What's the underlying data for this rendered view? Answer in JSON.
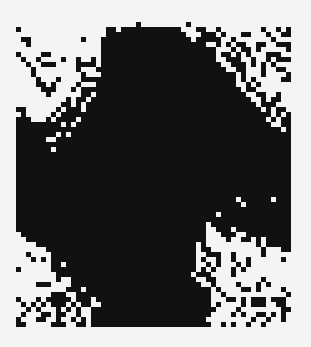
{
  "figure": {
    "type": "binary-pixel-grid",
    "cols": 56,
    "rows": 61,
    "cell_px": 5,
    "colors": {
      "on": "#111111",
      "off": "#f4f4f2"
    },
    "rows_data": [
      "0000000000000000000000001000000000100000000000000000000",
      "1000000000000000001101111111111110001100100000000100101",
      "0000000000000000001111111111111111000111010001100010011",
      "0110000000000100011111111111111111101111100100000001000",
      "0010000000000000011111111111111111111100101011001100111",
      "0000000000000000011111111111111111111111000101101000001",
      "1000011000000000011111111111111111111111011010100011100",
      "0100100001001001011111111111111111111111001110010010111",
      "0010011100001111011111111111111111111111100111010101000",
      "0001000000001000111111111111111111111111110011000100110",
      "0001000000000100011111111111111111111111111101000100001",
      "0000100010000111111111111111111111111111111101010000011",
      "0000110100001000111111111111111111111111111100101000000",
      "0000011100010111111111111111111111111111111110110000000",
      "0000001000000110111111111111111111111111111111001100100",
      "0000000000101101111111111111111111111111111111100101100",
      "0000000001101011111111111111111111111111111111110111000",
      "1100000010111011111111111111111111111111111111111010110",
      "0100000101111111111111111111111111111111111111111110101",
      "1110001011110111111111111111111111111111111111111101011",
      "1111111110101111111111111111111111111111111111111110011",
      "1111111111111111111111111111111111111111111111111111101",
      "1111111101011111111111111111111111111111111111111111111",
      "1111110011111111111111111111111111111111111111111111111",
      "1111111111111111111111111111111111111111111111111111111",
      "1111111011111111111111111111111111111111111111111111111",
      "1111111111111111111111111111111111111111111111111111111",
      "1111111111111111111111111111111111111111111111111111111",
      "1111111111111111111111111111111111111111111111111111111",
      "1111111111111111111111111111111111111111111111111111111",
      "1111111111111111111111111111111111111111111111111111111",
      "1111111111111111111111111111111111111111111111111111111",
      "1111111111111111111111111111111111111111111111111111111",
      "1111111111111111111111111111111111111111111111111111111",
      "1111111111111111111111111111111111111111111111111111111",
      "1111111111111111111111111111111111111111111101111110111",
      "1111111111111111111111111111111111111111111110111111111",
      "1111111111111111111111111111111111111111111111111111111",
      "1111111111111111111111111111111111111111011111111111111",
      "1111111111111111111111111111111111111111111111111111111",
      "1111111111111111111111111111111111111101111111111111111",
      "1111111111111111111111111111111111111100111011111111111",
      "0111111111111111111111111111111111111100011100111111111",
      "0011111111111111111111111111111111111100001001101011111",
      "0000111111111111111111111111111111110100000000001011111",
      "0000001111111111111111111111111111110110000000000100011",
      "0010000111111111111111111111111111110011100100000100000",
      "0001010111111111111111111111111111110100100100100000010",
      "0000000110111111111111111111111111110010100010100000000",
      "1000000111111111111111111111111111110101000101000000000",
      "0000000011111111111111111111111111101110000100000000000",
      "0000000010011111111111111111111111110011000000000100000",
      "0000111000011111111111111111111111111001000010001010000",
      "0000000000111011111111111111111111111110100001101000010",
      "0000000111001111111111111111111111111110010000000000001",
      "1000101111101110111111111111111111111110001101011101110",
      "0101010111010110011111111111111111111110100001011100110",
      "0010100010101001111111111111111111111111000010000000011",
      "0100011011001001111111111111111111111110000101001101010",
      "1000110010010101111111111111111111111100000000010010010",
      "1100000111001101111111111111111111111110010100100100000"
    ]
  }
}
